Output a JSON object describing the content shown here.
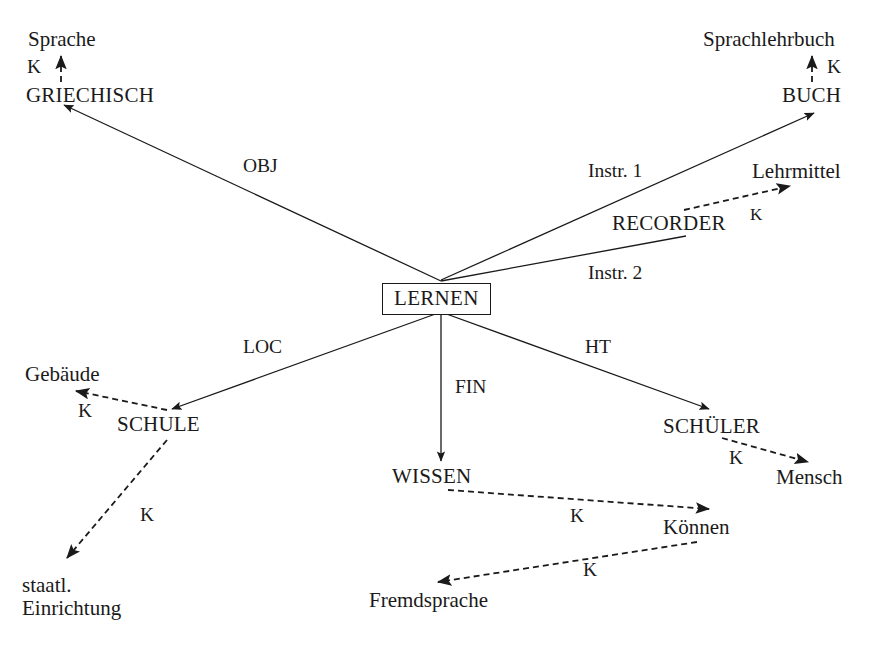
{
  "diagram": {
    "stroke_color": "#1a1a1a",
    "background_color": "#ffffff",
    "width": 879,
    "height": 645,
    "center_node": {
      "label": "LERNEN",
      "x": 382,
      "y": 283,
      "boxed": true
    },
    "concept_nodes": [
      {
        "id": "griechisch",
        "label": "GRIECHISCH",
        "x": 26,
        "y": 84,
        "kind": "concept"
      },
      {
        "id": "buch",
        "label": "BUCH",
        "x": 782,
        "y": 84,
        "kind": "concept"
      },
      {
        "id": "recorder",
        "label": "RECORDER",
        "x": 612,
        "y": 212,
        "kind": "concept"
      },
      {
        "id": "schule",
        "label": "SCHULE",
        "x": 117,
        "y": 413,
        "kind": "concept"
      },
      {
        "id": "wissen",
        "label": "WISSEN",
        "x": 392,
        "y": 465,
        "kind": "concept"
      },
      {
        "id": "schueler",
        "label": "SCHÜLER",
        "x": 663,
        "y": 415,
        "kind": "concept"
      }
    ],
    "feature_nodes": [
      {
        "id": "sprache",
        "label": "Sprache",
        "x": 28,
        "y": 28,
        "kind": "feature"
      },
      {
        "id": "sprachlehrbuch",
        "label": "Sprachlehrbuch",
        "x": 703,
        "y": 28,
        "kind": "feature"
      },
      {
        "id": "lehrmittel",
        "label": "Lehrmittel",
        "x": 752,
        "y": 160,
        "kind": "feature"
      },
      {
        "id": "gebaeude",
        "label": "Gebäude",
        "x": 25,
        "y": 363,
        "kind": "feature"
      },
      {
        "id": "mensch",
        "label": "Mensch",
        "x": 776,
        "y": 466,
        "kind": "feature"
      },
      {
        "id": "koennen",
        "label": "Können",
        "x": 663,
        "y": 516,
        "kind": "feature"
      },
      {
        "id": "fremdsprache",
        "label": "Fremdsprache",
        "x": 369,
        "y": 589,
        "kind": "feature"
      },
      {
        "id": "staatl-einrichtung",
        "label": "staatl.\nEinrichtung",
        "x": 22,
        "y": 574,
        "kind": "feature"
      }
    ],
    "solid_edges": [
      {
        "id": "obj",
        "label": "OBJ",
        "from": "LERNEN",
        "to": "GRIECHISCH",
        "x1": 441,
        "y1": 281,
        "x2": 64,
        "y2": 105,
        "arrow": true,
        "label_x": 243,
        "label_y": 155
      },
      {
        "id": "instr-1",
        "label": "Instr. 1",
        "from": "LERNEN",
        "to": "BUCH",
        "x1": 441,
        "y1": 280,
        "x2": 814,
        "y2": 113,
        "arrow": true,
        "label_x": 588,
        "label_y": 160
      },
      {
        "id": "instr-2",
        "label": "Instr. 2",
        "from": "LERNEN",
        "to": "RECORDER",
        "x1": 441,
        "y1": 281,
        "x2": 686,
        "y2": 236,
        "arrow": false,
        "label_x": 588,
        "label_y": 262
      },
      {
        "id": "loc",
        "label": "LOC",
        "from": "LERNEN",
        "to": "SCHULE",
        "x1": 441,
        "y1": 312,
        "x2": 172,
        "y2": 409,
        "arrow": true,
        "label_x": 243,
        "label_y": 336
      },
      {
        "id": "fin",
        "label": "FIN",
        "from": "LERNEN",
        "to": "WISSEN",
        "x1": 441,
        "y1": 312,
        "x2": 441,
        "y2": 461,
        "arrow": true,
        "label_x": 455,
        "label_y": 376
      },
      {
        "id": "ht",
        "label": "HT",
        "from": "LERNEN",
        "to": "SCHÜLER",
        "x1": 441,
        "y1": 312,
        "x2": 709,
        "y2": 409,
        "arrow": true,
        "label_x": 585,
        "label_y": 336
      }
    ],
    "dashed_edges": [
      {
        "id": "griechisch-sprache",
        "label": "K",
        "from": "GRIECHISCH",
        "to": "Sprache",
        "x1": 61,
        "y1": 82,
        "x2": 61,
        "y2": 56,
        "label_x": 27,
        "label_y": 56
      },
      {
        "id": "buch-sprachlehrbuch",
        "label": "K",
        "from": "BUCH",
        "to": "Sprachlehrbuch",
        "x1": 812,
        "y1": 82,
        "x2": 812,
        "y2": 56,
        "label_x": 827,
        "label_y": 56
      },
      {
        "id": "recorder-lehrmittel",
        "label": "K",
        "from": "RECORDER",
        "to": "Lehrmittel",
        "x1": 684,
        "y1": 210,
        "x2": 790,
        "y2": 186,
        "label_x": 750,
        "label_y": 205
      },
      {
        "id": "schule-gebaeude",
        "label": "K",
        "from": "SCHULE",
        "to": "Gebäude",
        "x1": 167,
        "y1": 410,
        "x2": 76,
        "y2": 391,
        "label_x": 78,
        "label_y": 400
      },
      {
        "id": "schule-staatl",
        "label": "K",
        "from": "SCHULE",
        "to": "staatl. Einrichtung",
        "x1": 167,
        "y1": 440,
        "x2": 67,
        "y2": 558,
        "label_x": 140,
        "label_y": 504
      },
      {
        "id": "schueler-mensch",
        "label": "K",
        "from": "SCHÜLER",
        "to": "Mensch",
        "x1": 722,
        "y1": 438,
        "x2": 808,
        "y2": 462,
        "label_x": 729,
        "label_y": 447
      },
      {
        "id": "wissen-koennen",
        "label": "K",
        "from": "WISSEN",
        "to": "Können",
        "x1": 448,
        "y1": 490,
        "x2": 709,
        "y2": 509,
        "label_x": 570,
        "label_y": 505
      },
      {
        "id": "koennen-fremdsprache",
        "label": "K",
        "from": "Können",
        "to": "Fremdsprache",
        "x1": 697,
        "y1": 542,
        "x2": 438,
        "y2": 582,
        "label_x": 583,
        "label_y": 559
      }
    ]
  }
}
